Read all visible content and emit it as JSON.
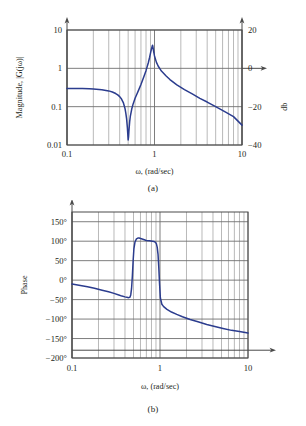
{
  "figure": {
    "panels": [
      {
        "id": "magnitude",
        "caption": "(a)",
        "xlabel": "ω, (rad/sec)",
        "ylabel_left": "Magnitude, |G(jω)|",
        "ylabel_right": "db",
        "x_ticks": [
          "0.1",
          "1",
          "10"
        ],
        "y_ticks_left": [
          "10",
          "1",
          "0.1",
          "0.01"
        ],
        "y_ticks_right": [
          "20",
          "0",
          "−20",
          "−40"
        ]
      },
      {
        "id": "phase",
        "caption": "(b)",
        "xlabel": "ω, (rad/sec)",
        "ylabel_left": "Phase",
        "x_ticks": [
          "0.1",
          "1",
          "10"
        ],
        "y_ticks_left": [
          "150°",
          "100°",
          "50°",
          "0°",
          "−50°",
          "−100°",
          "−150°",
          "−200°"
        ]
      }
    ]
  },
  "colors": {
    "curve": "#2b3c8e",
    "grid_minor": "#8a8a8a",
    "grid_major": "#6f6f6f",
    "frame": "#4a4a4a",
    "text": "#231f20",
    "background": "#ffffff"
  },
  "chart_data": [
    {
      "type": "line",
      "id": "magnitude-bode",
      "title": "",
      "xlabel": "ω, (rad/sec)",
      "ylabel": "Magnitude, |G(jω)|",
      "ylabel_secondary": "db",
      "xscale": "log",
      "yscale": "log",
      "xlim": [
        0.1,
        10
      ],
      "ylim": [
        0.01,
        10
      ],
      "ylim_secondary_db": [
        -40,
        20
      ],
      "grid": true,
      "legend": "none",
      "xtick_values": [
        0.1,
        1,
        10
      ],
      "xtick_labels": [
        "0.1",
        "1",
        "10"
      ],
      "ytick_values": [
        10,
        1,
        0.1,
        0.01
      ],
      "ytick_labels": [
        "10",
        "1",
        "0.1",
        "0.01"
      ],
      "ytick_secondary_values": [
        20,
        0,
        -20,
        -40
      ],
      "ytick_secondary_labels": [
        "20",
        "0",
        "−20",
        "−40"
      ],
      "annotations": [
        {
          "text": "notch at ω ≈ 0.5, |G| ≈ 0.013"
        },
        {
          "text": "resonant peak at ω ≈ 0.95, |G| ≈ 4.0"
        }
      ],
      "series": [
        {
          "name": "|G(jω)|",
          "color": "#2b3c8e",
          "x": [
            0.1,
            0.12,
            0.15,
            0.18,
            0.2,
            0.25,
            0.3,
            0.33,
            0.36,
            0.38,
            0.4,
            0.42,
            0.44,
            0.46,
            0.47,
            0.48,
            0.49,
            0.5,
            0.505,
            0.51,
            0.52,
            0.53,
            0.55,
            0.57,
            0.6,
            0.63,
            0.66,
            0.7,
            0.75,
            0.8,
            0.85,
            0.88,
            0.9,
            0.92,
            0.94,
            0.95,
            0.96,
            0.98,
            1.0,
            1.05,
            1.1,
            1.2,
            1.35,
            1.5,
            1.8,
            2.2,
            2.7,
            3.3,
            4.0,
            5.0,
            6.5,
            8.0,
            10.0
          ],
          "y": [
            0.3,
            0.3,
            0.298,
            0.294,
            0.29,
            0.278,
            0.258,
            0.242,
            0.22,
            0.203,
            0.183,
            0.158,
            0.128,
            0.09,
            0.068,
            0.048,
            0.028,
            0.0135,
            0.016,
            0.023,
            0.04,
            0.057,
            0.088,
            0.118,
            0.165,
            0.215,
            0.275,
            0.38,
            0.58,
            0.87,
            1.4,
            1.95,
            2.5,
            3.1,
            3.75,
            4.0,
            3.6,
            2.7,
            2.1,
            1.45,
            1.15,
            0.85,
            0.64,
            0.51,
            0.37,
            0.28,
            0.215,
            0.165,
            0.132,
            0.1,
            0.072,
            0.055,
            0.033
          ]
        }
      ]
    },
    {
      "type": "line",
      "id": "phase-bode",
      "title": "",
      "xlabel": "ω, (rad/sec)",
      "ylabel": "Phase",
      "xscale": "log",
      "yscale": "linear",
      "xlim": [
        0.1,
        10
      ],
      "ylim": [
        -200,
        175
      ],
      "grid": true,
      "legend": "none",
      "xtick_values": [
        0.1,
        1,
        10
      ],
      "xtick_labels": [
        "0.1",
        "1",
        "10"
      ],
      "ytick_values": [
        150,
        100,
        50,
        0,
        -50,
        -100,
        -150,
        -200
      ],
      "ytick_labels": [
        "150°",
        "100°",
        "50°",
        "0°",
        "−50°",
        "−100°",
        "−150°",
        "−200°"
      ],
      "annotations": [
        {
          "text": "phase jumps to ≈ +108° near ω = 0.55"
        },
        {
          "text": "phase drops sharply near ω = 1"
        }
      ],
      "series": [
        {
          "name": "∠G(jω)",
          "color": "#2b3c8e",
          "x": [
            0.1,
            0.12,
            0.15,
            0.18,
            0.22,
            0.26,
            0.3,
            0.34,
            0.37,
            0.4,
            0.42,
            0.44,
            0.455,
            0.465,
            0.475,
            0.485,
            0.495,
            0.505,
            0.52,
            0.54,
            0.56,
            0.58,
            0.6,
            0.64,
            0.7,
            0.76,
            0.82,
            0.86,
            0.89,
            0.91,
            0.93,
            0.95,
            0.97,
            0.99,
            1.01,
            1.05,
            1.1,
            1.2,
            1.35,
            1.55,
            1.8,
            2.2,
            2.7,
            3.4,
            4.2,
            5.2,
            6.5,
            8.0,
            10.0
          ],
          "y": [
            -10,
            -13,
            -17,
            -21,
            -26,
            -30,
            -34,
            -38,
            -41,
            -43,
            -44,
            -45,
            -44,
            -38,
            -22,
            10,
            50,
            80,
            98,
            106,
            108,
            108,
            107,
            105,
            102,
            101,
            100,
            99,
            97,
            93,
            84,
            66,
            30,
            -12,
            -46,
            -62,
            -68,
            -75,
            -82,
            -88,
            -94,
            -101,
            -107,
            -114,
            -119,
            -124,
            -129,
            -132,
            -136
          ]
        }
      ]
    }
  ]
}
